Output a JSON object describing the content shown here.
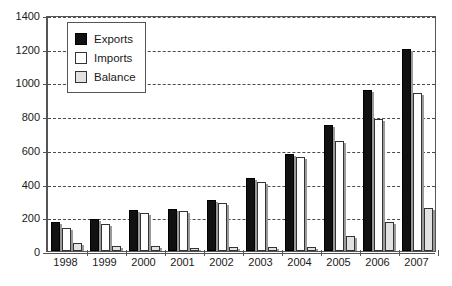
{
  "chart_data": {
    "type": "bar",
    "title": "",
    "subtitle": "",
    "xlabel": "",
    "ylabel": "",
    "categories": [
      "1998",
      "1999",
      "2000",
      "2001",
      "2002",
      "2003",
      "2004",
      "2005",
      "2006",
      "2007"
    ],
    "series": [
      {
        "name": "Exports",
        "color": "#111111",
        "values": [
          170,
          190,
          245,
          250,
          305,
          435,
          575,
          750,
          955,
          1200
        ]
      },
      {
        "name": "Imports",
        "color": "#ffffff",
        "values": [
          135,
          160,
          225,
          235,
          285,
          410,
          560,
          650,
          785,
          935
        ]
      },
      {
        "name": "Balance",
        "color": "#e2e2e2",
        "values": [
          45,
          30,
          30,
          20,
          25,
          25,
          25,
          90,
          170,
          255
        ]
      }
    ],
    "ylim": [
      0,
      1400
    ],
    "yticks": [
      0,
      200,
      400,
      600,
      800,
      1000,
      1200,
      1400
    ],
    "ytick_labels": [
      "0",
      "200",
      "400",
      "600",
      "800",
      "1000",
      "1200",
      "1400"
    ],
    "grid": true,
    "grid_axis": "y",
    "grid_style": "dashed",
    "legend_position": "top-left",
    "legend_entries": [
      "Exports",
      "Imports",
      "Balance"
    ]
  }
}
